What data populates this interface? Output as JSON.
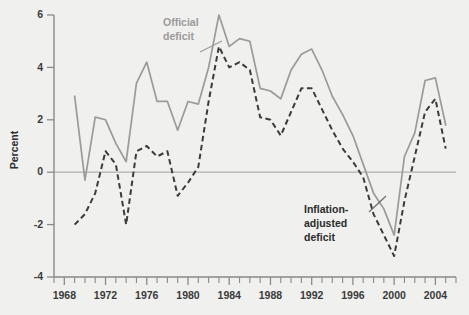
{
  "chart_data": {
    "type": "line",
    "title": "",
    "xlabel": "",
    "ylabel": "Percent",
    "xlim": [
      1967,
      2006
    ],
    "ylim": [
      -4,
      6
    ],
    "grid": false,
    "legend_position": "inline-annotation",
    "x_tick_labels": [
      "1968",
      "1972",
      "1976",
      "1980",
      "1984",
      "1988",
      "1992",
      "1996",
      "2000",
      "2004"
    ],
    "x_tick_values": [
      1968,
      1972,
      1976,
      1980,
      1984,
      1988,
      1992,
      1996,
      2000,
      2004
    ],
    "x_minor_tick_interval": 1,
    "y_tick_labels": [
      "6",
      "4",
      "2",
      "0",
      "-2",
      "-4"
    ],
    "y_tick_values": [
      6,
      4,
      2,
      0,
      -2,
      -4
    ],
    "zero_line": 0,
    "x": [
      1969,
      1970,
      1971,
      1972,
      1973,
      1974,
      1975,
      1976,
      1977,
      1978,
      1979,
      1980,
      1981,
      1982,
      1983,
      1984,
      1985,
      1986,
      1987,
      1988,
      1989,
      1990,
      1991,
      1992,
      1993,
      1994,
      1995,
      1996,
      1997,
      1998,
      1999,
      2000,
      2001,
      2002,
      2003,
      2004,
      2005
    ],
    "series": [
      {
        "name": "Official deficit",
        "style": "solid",
        "color": "#9a9a9a",
        "values": [
          2.9,
          -0.3,
          2.1,
          2.0,
          1.1,
          0.4,
          3.4,
          4.2,
          2.7,
          2.7,
          1.6,
          2.7,
          2.6,
          4.0,
          6.0,
          4.8,
          5.1,
          5.0,
          3.2,
          3.1,
          2.8,
          3.9,
          4.5,
          4.7,
          3.9,
          2.9,
          2.2,
          1.4,
          0.3,
          -0.8,
          -1.4,
          -2.4,
          0.6,
          1.5,
          3.5,
          3.6,
          1.8
        ]
      },
      {
        "name": "Inflation-adjusted deficit",
        "style": "dashed",
        "color": "#3b3b3b",
        "values": [
          -2.0,
          -1.6,
          -0.8,
          0.8,
          0.3,
          -2.0,
          0.8,
          1.0,
          0.6,
          0.8,
          -0.9,
          -0.4,
          0.2,
          2.7,
          4.8,
          4.0,
          4.2,
          3.9,
          2.1,
          2.0,
          1.4,
          2.3,
          3.2,
          3.2,
          2.4,
          1.6,
          0.9,
          0.4,
          -0.2,
          -1.6,
          -2.4,
          -3.2,
          -1.1,
          0.6,
          2.3,
          2.8,
          0.9
        ]
      }
    ],
    "annotations": [
      {
        "id": "official-deficit",
        "text_lines": [
          "Official",
          "deficit"
        ],
        "color": "#9a9a9a"
      },
      {
        "id": "inflation-adjusted-deficit",
        "text_lines": [
          "Inflation-",
          "adjusted",
          "deficit"
        ],
        "color": "#2b2b2b"
      }
    ]
  }
}
